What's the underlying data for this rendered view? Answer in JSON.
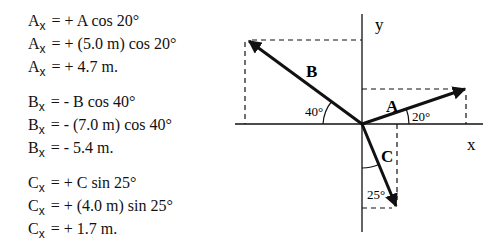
{
  "equations": {
    "A": [
      {
        "var": "A",
        "sub": "x",
        "rhs": "= + A cos 20°"
      },
      {
        "var": "A",
        "sub": "x",
        "rhs": "= + (5.0 m) cos 20°"
      },
      {
        "var": "A",
        "sub": "x",
        "rhs": "= + 4.7 m."
      }
    ],
    "B": [
      {
        "var": "B",
        "sub": "x",
        "rhs": "= - B cos 40°"
      },
      {
        "var": "B",
        "sub": "x",
        "rhs": "= - (7.0 m) cos 40°"
      },
      {
        "var": "B",
        "sub": "x",
        "rhs": "= - 5.4 m."
      }
    ],
    "C": [
      {
        "var": "C",
        "sub": "x",
        "rhs": "= + C sin 25°"
      },
      {
        "var": "C",
        "sub": "x",
        "rhs": "= + (4.0 m) sin 25°"
      },
      {
        "var": "C",
        "sub": "x",
        "rhs": "= + 1.7 m."
      }
    ]
  },
  "diagram": {
    "axis_labels": {
      "x": "x",
      "y": "y"
    },
    "vectors": {
      "A": {
        "label": "A",
        "angle_label": "20°",
        "magnitude": "5.0 m"
      },
      "B": {
        "label": "B",
        "angle_label": "40°",
        "magnitude": "7.0 m"
      },
      "C": {
        "label": "C",
        "angle_label": "25°",
        "magnitude": "4.0 m"
      }
    },
    "colors": {
      "ink": "#111111",
      "background": "#ffffff"
    }
  }
}
